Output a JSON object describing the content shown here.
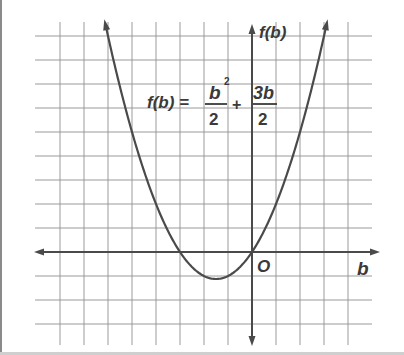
{
  "chart_data": {
    "type": "line",
    "title": "",
    "equation": {
      "lhs": "f(b) =",
      "term1_numerator": "b",
      "term1_exponent": "2",
      "term1_denominator": "2",
      "operator": "+",
      "term2_numerator": "3b",
      "term2_denominator": "2"
    },
    "xlabel": "b",
    "ylabel": "f(b)",
    "origin_label": "O",
    "xlim": [
      -9,
      4.5
    ],
    "ylim": [
      -3.5,
      9.5
    ],
    "grid": true,
    "legend": null,
    "series": [
      {
        "name": "f(b) = b^2/2 + 3b/2",
        "x": [
          -6,
          -5,
          -4,
          -3,
          -2,
          -1.5,
          -1,
          0,
          1,
          2,
          3
        ],
        "y": [
          9,
          5,
          2,
          0,
          -1,
          -1.125,
          -1,
          0,
          2,
          5,
          9
        ]
      }
    ],
    "key_points": {
      "roots": [
        -3,
        0
      ],
      "vertex": [
        -1.5,
        -1.125
      ]
    }
  },
  "colors": {
    "background": "#ffffff",
    "grid": "#9a9a9a",
    "axis": "#4a4a4a",
    "curve": "#4a4a4a",
    "text": "#3a3a3a",
    "border": "#8a8a8a"
  }
}
